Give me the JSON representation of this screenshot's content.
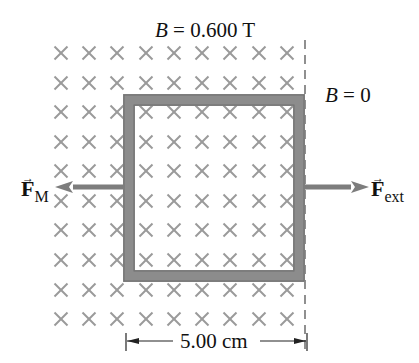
{
  "labels": {
    "field_inside": {
      "symbol": "B",
      "equals": "=",
      "value": "0.600 T"
    },
    "field_outside": {
      "symbol": "B",
      "equals": "=",
      "value": "0"
    },
    "force_magnetic": {
      "symbol": "F",
      "subscript": "M"
    },
    "force_external": {
      "symbol": "F",
      "subscript": "ext"
    },
    "dimension": "5.00 cm"
  },
  "field": {
    "symbol": "cross-into-page",
    "rows_y": [
      53,
      83,
      112,
      142,
      171,
      201,
      230,
      260,
      290,
      319
    ],
    "cols_x": [
      61,
      89,
      117,
      146,
      174,
      202,
      230,
      259,
      287
    ],
    "color": "#9a9a9a",
    "boundary_x": 305
  },
  "loop": {
    "x": 123,
    "y": 94,
    "width": 182,
    "height": 188,
    "thickness": 12,
    "color": "#8c8c8c"
  },
  "arrows": {
    "magnetic": {
      "from_x": 123,
      "to_x": 55,
      "y": 187,
      "color": "#7d7d7d"
    },
    "external": {
      "from_x": 305,
      "to_x": 369,
      "y": 187,
      "color": "#7d7d7d"
    }
  },
  "colors": {
    "text": "#111111",
    "dashed_line": "#555555"
  }
}
